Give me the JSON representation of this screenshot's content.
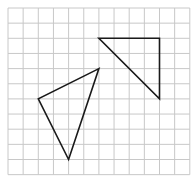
{
  "grid": {
    "origin_x": 8,
    "origin_y": 8,
    "cell_size": 15.15,
    "columns": 12,
    "rows": 11,
    "line_color": "#c8c8c8",
    "background": "#ffffff"
  },
  "shapes": [
    {
      "name": "right-triangle",
      "vertices_grid": [
        [
          6,
          2
        ],
        [
          10,
          2
        ],
        [
          10,
          6
        ]
      ],
      "stroke": "#1a1a1a",
      "stroke_width": 1.6
    },
    {
      "name": "scalene-triangle",
      "vertices_grid": [
        [
          6,
          4
        ],
        [
          2,
          6
        ],
        [
          4,
          10
        ]
      ],
      "stroke": "#1a1a1a",
      "stroke_width": 1.6
    }
  ]
}
